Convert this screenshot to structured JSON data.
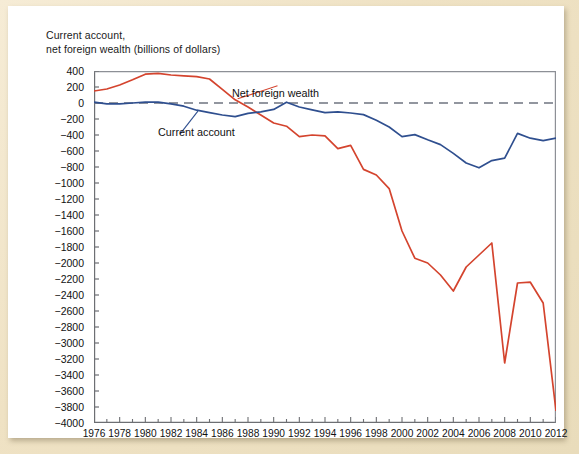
{
  "figure": {
    "axis_title": "Current account,\nnet foreign wealth (billions of dollars)",
    "colors": {
      "net_foreign_wealth": "#d4442e",
      "current_account": "#2f4f8f",
      "zero_line": "#6f7480",
      "axis": "#6d6f73",
      "frame": "#eee2c6"
    }
  },
  "labels": {
    "net_foreign_wealth": "Net foreign wealth",
    "current_account": "Current account"
  },
  "chart_data": {
    "type": "line",
    "title": "Current account, net foreign wealth (billions of dollars)",
    "xlabel": "",
    "ylabel": "Current account, net foreign wealth (billions of dollars)",
    "xlim": [
      1976,
      2012
    ],
    "ylim": [
      -4000,
      400
    ],
    "ytick_step": 200,
    "xtick_step": 2,
    "grid": false,
    "legend": "inline-annotations",
    "yticks": [
      400,
      200,
      0,
      -200,
      -400,
      -600,
      -800,
      -1000,
      -1200,
      -1400,
      -1600,
      -1800,
      -2000,
      -2200,
      -2400,
      -2600,
      -2800,
      -3000,
      -3200,
      -3400,
      -3600,
      -3800,
      -4000
    ],
    "xticks": [
      1976,
      1978,
      1980,
      1982,
      1984,
      1986,
      1988,
      1990,
      1992,
      1994,
      1996,
      1998,
      2000,
      2002,
      2004,
      2006,
      2008,
      2010,
      2012
    ],
    "x": [
      1976,
      1977,
      1978,
      1979,
      1980,
      1981,
      1982,
      1983,
      1984,
      1985,
      1986,
      1987,
      1988,
      1989,
      1990,
      1991,
      1992,
      1993,
      1994,
      1995,
      1996,
      1997,
      1998,
      1999,
      2000,
      2001,
      2002,
      2003,
      2004,
      2005,
      2006,
      2007,
      2008,
      2009,
      2010,
      2011,
      2012
    ],
    "series": [
      {
        "name": "Net foreign wealth",
        "color": "#d4442e",
        "values": [
          150,
          175,
          225,
          290,
          360,
          370,
          350,
          340,
          330,
          300,
          170,
          40,
          -50,
          -150,
          -250,
          -290,
          -420,
          -400,
          -410,
          -570,
          -530,
          -830,
          -900,
          -1070,
          -1600,
          -1940,
          -2000,
          -2150,
          -2350,
          -2050,
          -1900,
          -1750,
          -3250,
          -2250,
          -2240,
          -2500,
          -3850
        ]
      },
      {
        "name": "Current account",
        "color": "#2f4f8f",
        "values": [
          10,
          -10,
          -10,
          0,
          10,
          10,
          -10,
          -40,
          -90,
          -120,
          -150,
          -170,
          -130,
          -110,
          -80,
          10,
          -50,
          -85,
          -120,
          -110,
          -125,
          -145,
          -215,
          -300,
          -420,
          -395,
          -460,
          -520,
          -630,
          -750,
          -810,
          -720,
          -690,
          -380,
          -440,
          -470,
          -440
        ]
      }
    ],
    "annotations": [
      {
        "text": "Net foreign wealth",
        "near_year": 1987,
        "near_value": 260
      },
      {
        "text": "Current account",
        "near_year": 1983,
        "near_value": -300
      }
    ]
  }
}
